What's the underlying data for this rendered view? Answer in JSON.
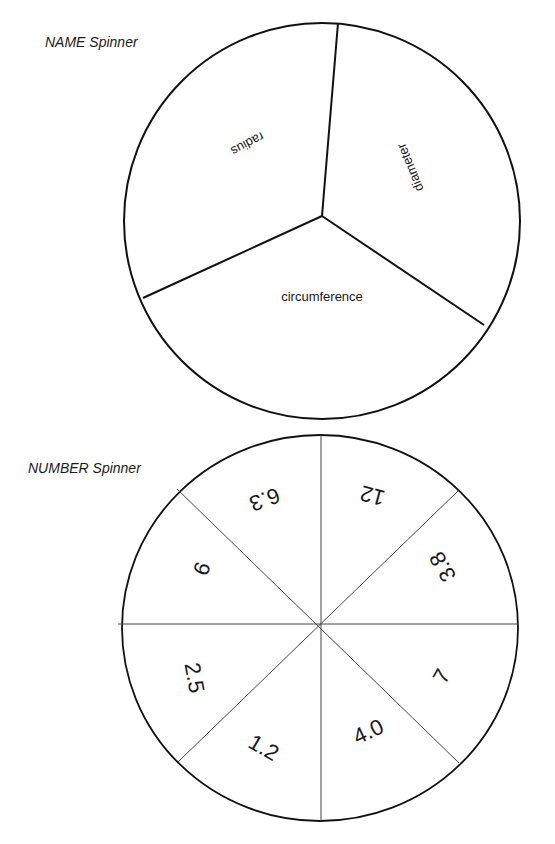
{
  "name_spinner": {
    "title": "NAME Spinner",
    "sections": [
      {
        "label": "radius",
        "x": 247,
        "y": 143,
        "rotate": 152
      },
      {
        "label": "diameter",
        "x": 411,
        "y": 167,
        "rotate": 248
      },
      {
        "label": "circumference",
        "x": 322,
        "y": 298,
        "rotate": 0
      }
    ]
  },
  "number_spinner": {
    "title": "NUMBER Spinner",
    "sections": [
      {
        "label": "12",
        "x": 373,
        "y": 494,
        "rotate": 195
      },
      {
        "label": "3.8",
        "x": 444,
        "y": 566,
        "rotate": 240
      },
      {
        "label": "7",
        "x": 443,
        "y": 677,
        "rotate": 300
      },
      {
        "label": "4.0",
        "x": 369,
        "y": 733,
        "rotate": 335
      },
      {
        "label": "1.2",
        "x": 263,
        "y": 749,
        "rotate": 30
      },
      {
        "label": "2.5",
        "x": 193,
        "y": 678,
        "rotate": 80
      },
      {
        "label": "9",
        "x": 200,
        "y": 568,
        "rotate": 110
      },
      {
        "label": "6.3",
        "x": 264,
        "y": 498,
        "rotate": 160
      }
    ]
  }
}
